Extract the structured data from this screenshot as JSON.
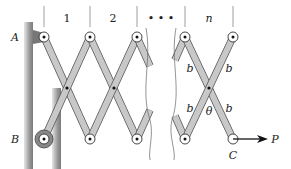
{
  "diagram": {
    "type": "lazy-tongs mechanism",
    "bay_labels": [
      "1",
      "2",
      "• • •",
      "n"
    ],
    "point_labels": {
      "A": "A",
      "B": "B",
      "C": "C"
    },
    "force_label": "P",
    "length_labels": [
      "b",
      "b",
      "b",
      "b"
    ],
    "angle_label": "θ",
    "colors": {
      "link_fill": "#c8c8c8",
      "link_stroke": "#555555",
      "wall": "#8a8a8a",
      "ink": "#222222"
    }
  }
}
